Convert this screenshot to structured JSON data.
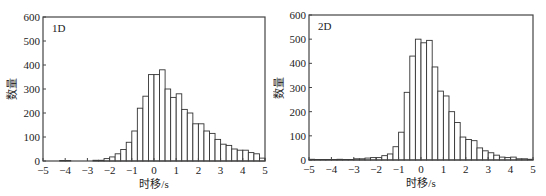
{
  "chart_data": [
    {
      "type": "bar",
      "panel_label": "1D",
      "title": "",
      "xlabel": "时移/s",
      "ylabel": "数量",
      "xlim": [
        -5,
        5
      ],
      "ylim": [
        0,
        600
      ],
      "xticks": [
        -5,
        -4,
        -3,
        -2,
        -1,
        0,
        1,
        2,
        3,
        4,
        5
      ],
      "yticks": [
        0,
        100,
        200,
        300,
        400,
        500,
        600
      ],
      "bin_width": 0.25,
      "grid": false,
      "legend": "none",
      "bin_starts": [
        -5,
        -4.75,
        -4.5,
        -4.25,
        -4,
        -3.75,
        -3.5,
        -3.25,
        -3,
        -2.75,
        -2.5,
        -2.25,
        -2,
        -1.75,
        -1.5,
        -1.25,
        -1,
        -0.75,
        -0.5,
        -0.25,
        0,
        0.25,
        0.5,
        0.75,
        1,
        1.25,
        1.5,
        1.75,
        2,
        2.25,
        2.5,
        2.75,
        3,
        3.25,
        3.5,
        3.75,
        4,
        4.25,
        4.5,
        4.75
      ],
      "values": [
        0,
        0,
        0,
        2,
        2,
        0,
        0,
        0,
        0,
        3,
        3,
        10,
        17,
        30,
        48,
        78,
        125,
        220,
        270,
        360,
        360,
        380,
        300,
        265,
        280,
        215,
        200,
        155,
        155,
        125,
        115,
        90,
        70,
        65,
        50,
        45,
        45,
        35,
        30,
        12
      ]
    },
    {
      "type": "bar",
      "panel_label": "2D",
      "title": "",
      "xlabel": "时移/s",
      "ylabel": "数量",
      "xlim": [
        -5,
        5
      ],
      "ylim": [
        0,
        600
      ],
      "xticks": [
        -5,
        -4,
        -3,
        -2,
        -1,
        0,
        1,
        2,
        3,
        4,
        5
      ],
      "yticks": [
        0,
        100,
        200,
        300,
        400,
        500,
        600
      ],
      "bin_width": 0.25,
      "grid": false,
      "legend": "none",
      "bin_starts": [
        -5,
        -4.75,
        -4.5,
        -4.25,
        -4,
        -3.75,
        -3.5,
        -3.25,
        -3,
        -2.75,
        -2.5,
        -2.25,
        -2,
        -1.75,
        -1.5,
        -1.25,
        -1,
        -0.75,
        -0.5,
        -0.25,
        0,
        0.25,
        0.5,
        0.75,
        1,
        1.25,
        1.5,
        1.75,
        2,
        2.25,
        2.5,
        2.75,
        3,
        3.25,
        3.5,
        3.75,
        4,
        4.25,
        4.5,
        4.75
      ],
      "values": [
        3,
        2,
        2,
        2,
        2,
        3,
        2,
        2,
        5,
        5,
        8,
        10,
        10,
        18,
        25,
        55,
        115,
        280,
        430,
        500,
        485,
        495,
        385,
        285,
        265,
        200,
        155,
        95,
        85,
        80,
        50,
        38,
        30,
        20,
        12,
        10,
        12,
        5,
        5,
        3
      ]
    }
  ],
  "caption": ""
}
